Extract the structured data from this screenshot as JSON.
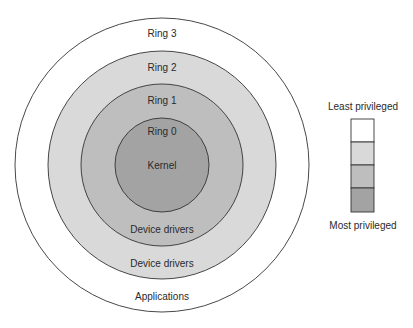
{
  "diagram": {
    "rings": [
      {
        "id": "ring3",
        "label": "Ring 3",
        "content": "Applications",
        "fill": "#ffffff"
      },
      {
        "id": "ring2",
        "label": "Ring 2",
        "content": "Device drivers",
        "fill": "#d9d9d9"
      },
      {
        "id": "ring1",
        "label": "Ring 1",
        "content": "Device drivers",
        "fill": "#bebebe"
      },
      {
        "id": "ring0",
        "label": "Ring 0",
        "content": "Kernel",
        "fill": "#a3a3a3"
      }
    ],
    "legend": {
      "top_label": "Least privileged",
      "bottom_label": "Most privileged",
      "swatches": [
        "#ffffff",
        "#d9d9d9",
        "#bebebe",
        "#a3a3a3"
      ]
    }
  }
}
